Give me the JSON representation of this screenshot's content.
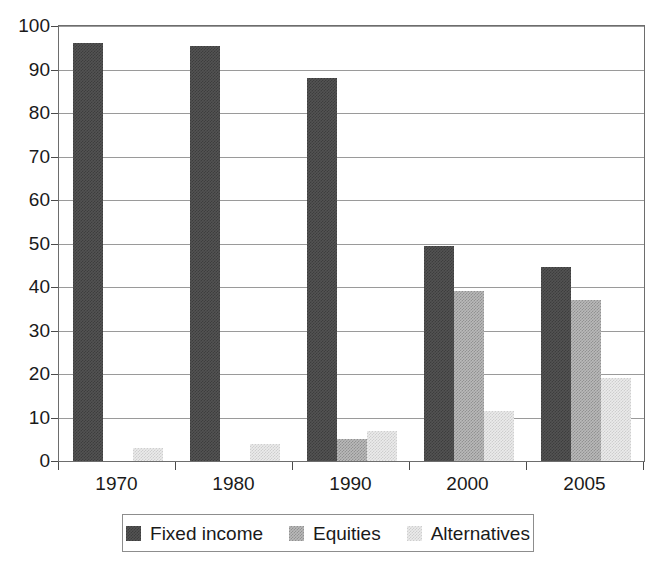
{
  "chart_data": {
    "type": "bar",
    "title": "",
    "subtitle": "",
    "xlabel": "",
    "ylabel": "",
    "categories": [
      "1970",
      "1980",
      "1990",
      "2000",
      "2005"
    ],
    "series": [
      {
        "name": "Fixed income",
        "color": "#535353",
        "values": [
          96,
          95.5,
          88,
          49.5,
          44.5
        ]
      },
      {
        "name": "Equities",
        "color": "#b9b9b9",
        "values": [
          0,
          0,
          5,
          39,
          37
        ]
      },
      {
        "name": "Alternatives",
        "color": "#ebebeb",
        "values": [
          3,
          4,
          7,
          11.5,
          19
        ]
      }
    ],
    "ylim": [
      0,
      100
    ],
    "yticks": [
      "0",
      "10",
      "20",
      "30",
      "40",
      "50",
      "60",
      "70",
      "80",
      "90",
      "100"
    ],
    "grid": true,
    "grid_axis": "y",
    "legend_position": "bottom-center",
    "legend_entries": [
      "Fixed income",
      "Equities",
      "Alternatives"
    ],
    "annotations": []
  },
  "colors": {
    "fixed_income": "#535353",
    "equities": "#b9b9b9",
    "alternatives": "#ebebeb",
    "gridline": "#9a9a9a",
    "axis": "#4a4a4a",
    "background": "#ffffff"
  }
}
